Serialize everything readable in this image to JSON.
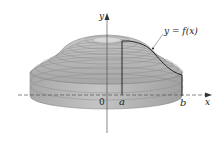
{
  "diagram": {
    "type": "solid-of-revolution",
    "labels": {
      "y_axis": "y",
      "x_axis": "x",
      "origin": "0",
      "a": "a",
      "b": "b",
      "curve": "y = f(x)"
    },
    "colors": {
      "background": "#ffffff",
      "solid_fill": "#b4b4b4",
      "solid_dark": "#9a9a9a",
      "ring_lines": "#8c8c8c",
      "top_hole": "#d6d6d6",
      "curve": "#1a1a1a",
      "axes": "#444444"
    }
  }
}
